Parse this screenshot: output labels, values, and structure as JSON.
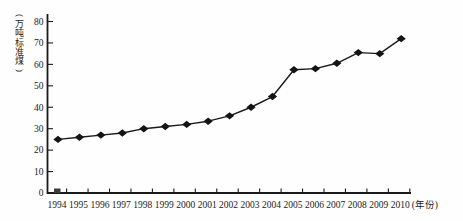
{
  "chart_data": {
    "type": "line",
    "title": "",
    "categories": [
      "1994",
      "1995",
      "1996",
      "1997",
      "1998",
      "1999",
      "2000",
      "2001",
      "2002",
      "2003",
      "2004",
      "2005",
      "2006",
      "2007",
      "2008",
      "2009",
      "2010"
    ],
    "values": [
      25,
      26,
      27,
      28,
      30,
      31,
      32,
      33.5,
      36,
      40,
      45,
      57.5,
      58,
      60.5,
      65.5,
      65,
      72
    ],
    "series_name": "能源消耗量",
    "xlabel": "(年份)",
    "ylabel": "(万吨标准煤)",
    "ylabel_chars": [
      "(",
      "万",
      "吨",
      "标",
      "准",
      "煤",
      ")"
    ],
    "yticks": [
      0,
      10,
      20,
      30,
      40,
      50,
      60,
      70,
      80
    ],
    "ylim": [
      0,
      80
    ],
    "grid": false,
    "legend_position": "none",
    "line_color": "#1a1a1a",
    "marker": "diamond",
    "marker_color": "#141414",
    "background": "#fefefe",
    "baseline_artifact": {
      "present": true,
      "near_category": "1994",
      "description": "small dark square mark sitting on the x-axis baseline just left of the 1994 tick"
    }
  }
}
